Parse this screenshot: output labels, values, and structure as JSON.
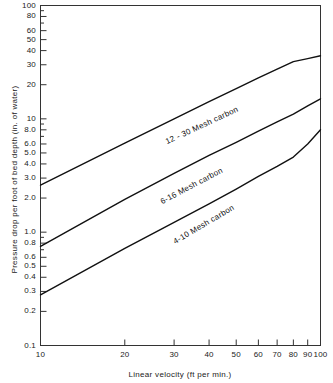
{
  "chart_data": {
    "type": "line",
    "title": "",
    "xlabel": "Linear  velocity (ft per min.)",
    "ylabel": "Pressure  drop  per  foot  of  bed  depth  (in.  of  water)",
    "xscale": "log",
    "yscale": "log",
    "xlim": [
      10,
      100
    ],
    "ylim": [
      0.1,
      100
    ],
    "grid": false,
    "legend_position": "inline-on-curve",
    "xticks": [
      10,
      20,
      30,
      40,
      50,
      60,
      70,
      80,
      90,
      100
    ],
    "xtick_labels": [
      "10",
      "20",
      "30",
      "40",
      "50",
      "60",
      "70",
      "80",
      "90",
      "100"
    ],
    "yticks": [
      0.1,
      0.2,
      0.3,
      0.4,
      0.5,
      0.6,
      0.8,
      1.0,
      2.0,
      3.0,
      4.0,
      5.0,
      6.0,
      8.0,
      10,
      20,
      30,
      40,
      50,
      60,
      80,
      100
    ],
    "ytick_labels": [
      "0.1",
      "0.2",
      "0.3",
      "0.4",
      "0.5",
      "0.6",
      "0.8",
      "1.0",
      "2.0",
      "3.0",
      "4.0",
      "5.0",
      "6.0",
      "8.0",
      "10",
      "20",
      "30",
      "40",
      "50",
      "60",
      "80",
      "100"
    ],
    "series": [
      {
        "name": "12 - 30  Mesh  carbon",
        "x": [
          10,
          20,
          30,
          40,
          50,
          60,
          70,
          80,
          90,
          100
        ],
        "values": [
          2.6,
          6.1,
          10.0,
          14.2,
          18.5,
          23.0,
          27.5,
          32.0,
          34.0,
          36.0
        ],
        "label_x": 28,
        "label_y": 6.3
      },
      {
        "name": "6-16  Mesh  carbon",
        "x": [
          10,
          20,
          30,
          40,
          50,
          60,
          70,
          80,
          90,
          100
        ],
        "values": [
          0.75,
          1.95,
          3.3,
          4.75,
          6.2,
          7.8,
          9.4,
          11.0,
          13.0,
          15.0
        ],
        "label_x": 27,
        "label_y": 1.85
      },
      {
        "name": "4-10  Mesh  carbon",
        "x": [
          10,
          20,
          30,
          40,
          50,
          60,
          70,
          80,
          90,
          100
        ],
        "values": [
          0.28,
          0.72,
          1.22,
          1.78,
          2.4,
          3.1,
          3.8,
          4.6,
          6.0,
          8.0
        ],
        "label_x": 30,
        "label_y": 0.82
      }
    ],
    "colors": {
      "line": "#111111",
      "axis": "#333333",
      "background": "#ffffff",
      "text": "#222222"
    }
  }
}
